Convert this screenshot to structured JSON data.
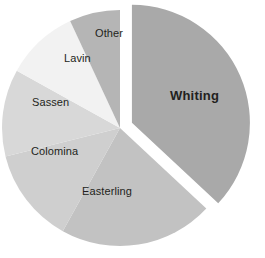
{
  "chart_data": {
    "type": "pie",
    "title": "",
    "subtitle": "",
    "xlabel": "",
    "ylabel": "",
    "grid": false,
    "legend_position": "none",
    "labels_inside_slices": true,
    "start_angle_deg": 0,
    "direction": "clockwise",
    "exploded_slice": "Whiting",
    "categories": [
      "Whiting",
      "Easterling",
      "Colomina",
      "Sassen",
      "Lavin",
      "Other"
    ],
    "values": [
      37,
      21,
      13,
      12,
      10,
      7
    ],
    "slices": [
      {
        "label": "Whiting",
        "value": 37,
        "color": "#a9a9a9",
        "exploded": true,
        "emphasis": true,
        "start_deg": 0,
        "end_deg": 133
      },
      {
        "label": "Easterling",
        "value": 21,
        "color": "#c2c2c2",
        "exploded": false,
        "emphasis": false,
        "start_deg": 133,
        "end_deg": 209
      },
      {
        "label": "Colomina",
        "value": 13,
        "color": "#cfcfcf",
        "exploded": false,
        "emphasis": false,
        "start_deg": 209,
        "end_deg": 256
      },
      {
        "label": "Sassen",
        "value": 12,
        "color": "#d8d8d8",
        "exploded": false,
        "emphasis": false,
        "start_deg": 256,
        "end_deg": 299
      },
      {
        "label": "Lavin",
        "value": 10,
        "color": "#f2f2f2",
        "exploded": false,
        "emphasis": false,
        "start_deg": 299,
        "end_deg": 335
      },
      {
        "label": "Other",
        "value": 7,
        "color": "#b5b5b5",
        "exploded": false,
        "emphasis": false,
        "start_deg": 335,
        "end_deg": 360
      }
    ],
    "colors": {
      "whiting": "#a9a9a9",
      "easterling": "#c2c2c2",
      "colomina": "#cfcfcf",
      "sassen": "#d8d8d8",
      "lavin": "#f2f2f2",
      "other": "#b5b5b5",
      "background": "#ffffff",
      "label_text": "#231f20"
    }
  },
  "labels": {
    "whiting": "Whiting",
    "easterling": "Easterling",
    "colomina": "Colomina",
    "sassen": "Sassen",
    "lavin": "Lavin",
    "other": "Other"
  }
}
